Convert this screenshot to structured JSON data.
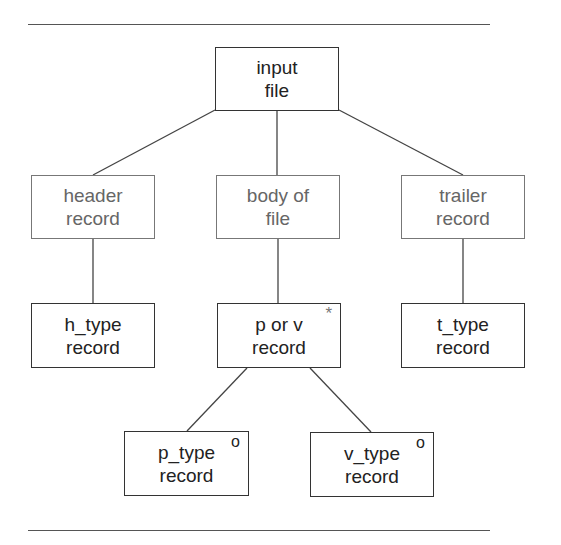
{
  "diagram": {
    "type": "tree",
    "nodes": [
      {
        "id": "input_file",
        "line1": "input",
        "line2": "file",
        "style": "bold",
        "marker": ""
      },
      {
        "id": "header_record",
        "line1": "header",
        "line2": "record",
        "style": "light",
        "marker": ""
      },
      {
        "id": "body_of_file",
        "line1": "body of",
        "line2": "file",
        "style": "light",
        "marker": ""
      },
      {
        "id": "trailer_record",
        "line1": "trailer",
        "line2": "record",
        "style": "light",
        "marker": ""
      },
      {
        "id": "h_type_record",
        "line1": "h_type",
        "line2": "record",
        "style": "bold",
        "marker": ""
      },
      {
        "id": "p_or_v_record",
        "line1": "p or v",
        "line2": "record",
        "style": "bold",
        "marker": "*"
      },
      {
        "id": "t_type_record",
        "line1": "t_type",
        "line2": "record",
        "style": "bold",
        "marker": ""
      },
      {
        "id": "p_type_record",
        "line1": "p_type",
        "line2": "record",
        "style": "bold",
        "marker": "o"
      },
      {
        "id": "v_type_record",
        "line1": "v_type",
        "line2": "record",
        "style": "bold",
        "marker": "o"
      }
    ],
    "edges": [
      [
        "input_file",
        "header_record"
      ],
      [
        "input_file",
        "body_of_file"
      ],
      [
        "input_file",
        "trailer_record"
      ],
      [
        "header_record",
        "h_type_record"
      ],
      [
        "body_of_file",
        "p_or_v_record"
      ],
      [
        "trailer_record",
        "t_type_record"
      ],
      [
        "p_or_v_record",
        "p_type_record"
      ],
      [
        "p_or_v_record",
        "v_type_record"
      ]
    ]
  }
}
